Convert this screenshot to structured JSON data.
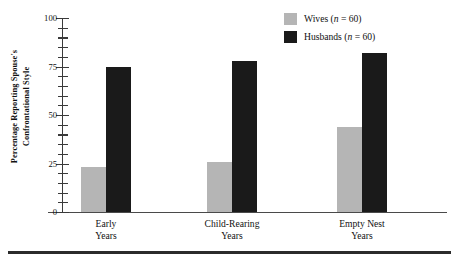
{
  "chart_data": {
    "type": "bar",
    "title": "",
    "xlabel": "",
    "ylabel": "Percentage Reporting Spouse's\nConfrontational Style",
    "ylim": [
      0,
      100
    ],
    "ytick_labels": [
      "0",
      "25",
      "50",
      "75",
      "100"
    ],
    "ytick_values": [
      0,
      25,
      50,
      75,
      100
    ],
    "yminor_step": 5,
    "grid": false,
    "legend_position": "top-right",
    "categories": [
      "Early\nYears",
      "Child-Rearing\nYears",
      "Empty Nest\nYears"
    ],
    "series": [
      {
        "name": "Wives",
        "legend_label": "Wives (n = 60)",
        "n": 60,
        "color": "#b5b5b5",
        "values": [
          23,
          26,
          44
        ]
      },
      {
        "name": "Husbands",
        "legend_label": "Husbands (n = 60)",
        "n": 60,
        "color": "#1a1a1a",
        "values": [
          75,
          78,
          82
        ]
      }
    ]
  },
  "legend": {
    "items": [
      {
        "label_prefix": "Wives (",
        "label_italic": "n",
        "label_suffix": " = 60)"
      },
      {
        "label_prefix": "Husbands (",
        "label_italic": "n",
        "label_suffix": " = 60)"
      }
    ]
  }
}
